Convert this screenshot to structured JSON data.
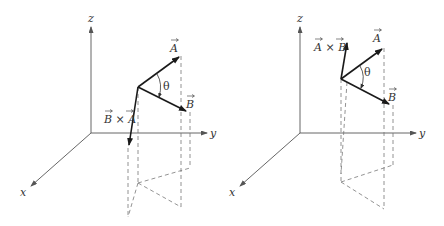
{
  "diagrams": [
    {
      "id": "left",
      "title": "B cross A",
      "axes": {
        "x": "x",
        "y": "y",
        "z": "z"
      },
      "vectors": {
        "a": "A",
        "b": "B",
        "cross": "B × A"
      },
      "angle": "θ"
    },
    {
      "id": "right",
      "title": "A cross B",
      "axes": {
        "x": "x",
        "y": "y",
        "z": "z"
      },
      "vectors": {
        "a": "A",
        "b": "B",
        "cross": "A × B"
      },
      "angle": "θ"
    }
  ],
  "colors": {
    "vector": "#1a1a1a",
    "axis": "#555555",
    "dashed": "#777777"
  }
}
